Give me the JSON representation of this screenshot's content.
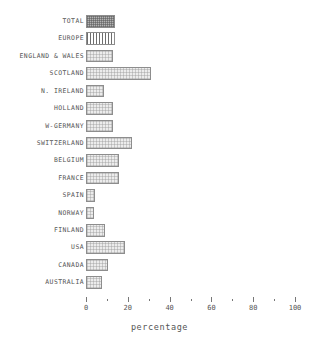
{
  "chart_data": {
    "type": "bar",
    "orientation": "horizontal",
    "title": "",
    "xlabel": "percentage",
    "ylabel": "",
    "xlim": [
      0,
      100
    ],
    "xticks": [
      0,
      20,
      40,
      60,
      80,
      100
    ],
    "xtick_labels": [
      "0",
      "20",
      "40",
      "60",
      "80",
      "100"
    ],
    "minor_tick_interval": 10,
    "grid": false,
    "legend": false,
    "categories": [
      "TOTAL",
      "EUROPE",
      "ENGLAND & WALES",
      "SCOTLAND",
      "N. IRELAND",
      "HOLLAND",
      "W-GERMANY",
      "SWITZERLAND",
      "BELGIUM",
      "FRANCE",
      "SPAIN",
      "NORWAY",
      "FINLAND",
      "USA",
      "CANADA",
      "AUSTRALIA"
    ],
    "values": [
      14,
      14,
      13,
      31,
      8.5,
      13,
      13,
      22,
      16,
      16,
      4.5,
      4,
      9,
      18.5,
      10.5,
      7.5
    ],
    "fills": [
      "crosshatch",
      "vertical-stripes",
      "dotted",
      "dotted",
      "dotted",
      "dotted",
      "dotted",
      "dotted",
      "dotted",
      "dotted",
      "dotted",
      "dotted",
      "dotted",
      "dotted",
      "dotted",
      "dotted"
    ],
    "bars": [
      {
        "label": "TOTAL",
        "value": 14,
        "fill": "crosshatch"
      },
      {
        "label": "EUROPE",
        "value": 14,
        "fill": "vertical-stripes"
      },
      {
        "label": "ENGLAND & WALES",
        "value": 13,
        "fill": "dotted"
      },
      {
        "label": "SCOTLAND",
        "value": 31,
        "fill": "dotted"
      },
      {
        "label": "N. IRELAND",
        "value": 8.5,
        "fill": "dotted"
      },
      {
        "label": "HOLLAND",
        "value": 13,
        "fill": "dotted"
      },
      {
        "label": "W-GERMANY",
        "value": 13,
        "fill": "dotted"
      },
      {
        "label": "SWITZERLAND",
        "value": 22,
        "fill": "dotted"
      },
      {
        "label": "BELGIUM",
        "value": 16,
        "fill": "dotted"
      },
      {
        "label": "FRANCE",
        "value": 16,
        "fill": "dotted"
      },
      {
        "label": "SPAIN",
        "value": 4.5,
        "fill": "dotted"
      },
      {
        "label": "NORWAY",
        "value": 4,
        "fill": "dotted"
      },
      {
        "label": "FINLAND",
        "value": 9,
        "fill": "dotted"
      },
      {
        "label": "USA",
        "value": 18.5,
        "fill": "dotted"
      },
      {
        "label": "CANADA",
        "value": 10.5,
        "fill": "dotted"
      },
      {
        "label": "AUSTRALIA",
        "value": 7.5,
        "fill": "dotted"
      }
    ],
    "colors": {
      "bar_outline": "#8d8d8d",
      "bar_fill_light": "#ececec",
      "bar_fill_dark": "#b4b4b4",
      "text": "#555555",
      "axis": "#777777",
      "background": "#ffffff"
    }
  }
}
